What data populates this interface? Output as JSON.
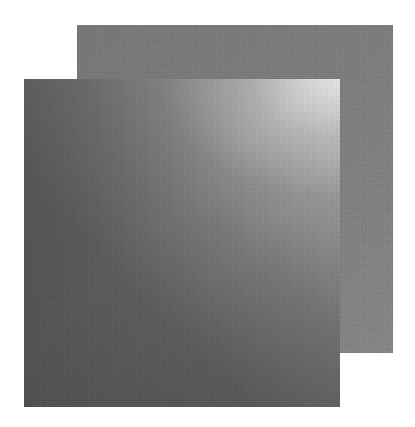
{
  "canvas": {
    "width": 415,
    "height": 427,
    "background": "#ffffff"
  },
  "shapes": [
    {
      "id": "back-square",
      "type": "square",
      "x": 77,
      "y": 25,
      "width": 316,
      "height": 328,
      "fill": "gradient",
      "colors": [
        "#777777",
        "#7d7d7d",
        "#868686"
      ],
      "texture": "grain"
    },
    {
      "id": "front-square",
      "type": "square",
      "x": 24,
      "y": 79,
      "width": 316,
      "height": 328,
      "fill": "gradient",
      "highlight_corner": "top-right",
      "colors": [
        "#4e4e4e",
        "#5e5e5e",
        "#777777",
        "#9a9a9a",
        "#e0e0e0"
      ],
      "texture": "grain"
    }
  ]
}
